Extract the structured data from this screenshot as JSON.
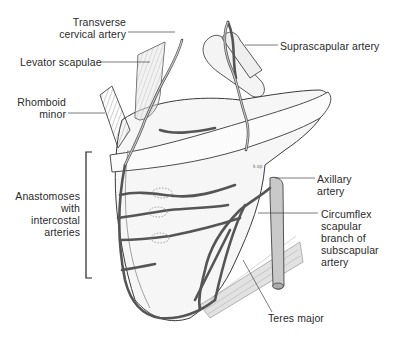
{
  "figure": {
    "colors": {
      "background": "#ffffff",
      "line": "#3a3a3a",
      "artery_fill": "#bdbdbd",
      "bone_fill": "#f3f3f3",
      "muscle_fill": "#d9d9d9",
      "text": "#2a2a2a"
    },
    "labels": {
      "transverse_cervical": [
        "Transverse",
        "cervical artery"
      ],
      "levator_scapulae": "Levator scapulae",
      "rhomboid_minor": [
        "Rhomboid",
        "minor"
      ],
      "anastomoses": [
        "Anastomoses",
        "with",
        "intercostal",
        "arteries"
      ],
      "suprascapular": "Suprascapular artery",
      "axillary": [
        "Axillary",
        "artery"
      ],
      "circumflex": [
        "Circumflex",
        "scapular",
        "branch of",
        "subscapular",
        "artery"
      ],
      "teres_major": "Teres major"
    },
    "signature": "k.sp"
  }
}
